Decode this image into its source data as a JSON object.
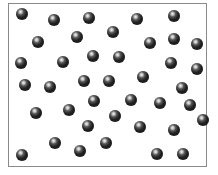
{
  "diagram": {
    "type": "particle-box",
    "box": {
      "left": 8,
      "top": 3,
      "width": 199,
      "height": 164,
      "border_color": "#8a8a8a"
    },
    "particle": {
      "diameter": 12,
      "color": "#2b2b2b",
      "highlight": "#f4f4f4"
    },
    "particle_count": 41,
    "particles": [
      {
        "x": 22,
        "y": 14
      },
      {
        "x": 54,
        "y": 20
      },
      {
        "x": 89,
        "y": 18
      },
      {
        "x": 137,
        "y": 19
      },
      {
        "x": 174,
        "y": 16
      },
      {
        "x": 38,
        "y": 42
      },
      {
        "x": 77,
        "y": 37
      },
      {
        "x": 113,
        "y": 32
      },
      {
        "x": 150,
        "y": 43
      },
      {
        "x": 174,
        "y": 39
      },
      {
        "x": 197,
        "y": 44
      },
      {
        "x": 21,
        "y": 63
      },
      {
        "x": 63,
        "y": 62
      },
      {
        "x": 93,
        "y": 56
      },
      {
        "x": 119,
        "y": 57
      },
      {
        "x": 171,
        "y": 63
      },
      {
        "x": 197,
        "y": 69
      },
      {
        "x": 25,
        "y": 85
      },
      {
        "x": 50,
        "y": 87
      },
      {
        "x": 84,
        "y": 81
      },
      {
        "x": 109,
        "y": 81
      },
      {
        "x": 143,
        "y": 77
      },
      {
        "x": 182,
        "y": 88
      },
      {
        "x": 36,
        "y": 113
      },
      {
        "x": 69,
        "y": 110
      },
      {
        "x": 94,
        "y": 101
      },
      {
        "x": 131,
        "y": 100
      },
      {
        "x": 160,
        "y": 103
      },
      {
        "x": 190,
        "y": 105
      },
      {
        "x": 88,
        "y": 126
      },
      {
        "x": 115,
        "y": 116
      },
      {
        "x": 140,
        "y": 127
      },
      {
        "x": 174,
        "y": 130
      },
      {
        "x": 22,
        "y": 155
      },
      {
        "x": 55,
        "y": 143
      },
      {
        "x": 80,
        "y": 151
      },
      {
        "x": 106,
        "y": 143
      },
      {
        "x": 157,
        "y": 154
      },
      {
        "x": 183,
        "y": 154
      },
      {
        "x": 6,
        "y": 132
      },
      {
        "x": 203,
        "y": 120
      }
    ]
  }
}
